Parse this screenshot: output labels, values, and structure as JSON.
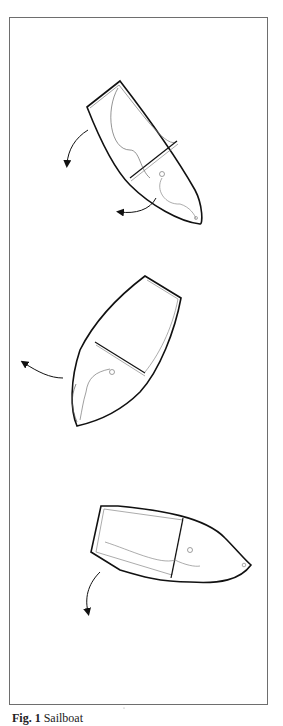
{
  "figure": {
    "caption_label": "Fig. 1",
    "caption_text": "Sailboat"
  },
  "boats": [
    {
      "id": "boat-1",
      "position": "top",
      "arrows": [
        "left-down",
        "bottom-left"
      ]
    },
    {
      "id": "boat-2",
      "position": "middle",
      "arrows": [
        "left-up"
      ]
    },
    {
      "id": "boat-3",
      "position": "bottom",
      "arrows": [
        "down-left"
      ]
    }
  ],
  "colors": {
    "stroke": "#111111",
    "thin_stroke": "#777777",
    "frame": "#6e6e6e",
    "background": "#ffffff"
  }
}
